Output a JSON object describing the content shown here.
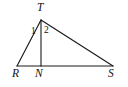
{
  "figure": {
    "type": "geometry-diagram",
    "shape": "triangle-with-cevian",
    "background_color": "#ffffff",
    "stroke_color": "#1a1a1a",
    "label_color": "#111111",
    "vertices": [
      {
        "id": "T",
        "label": "T",
        "x": 41,
        "y": 20,
        "role": "apex"
      },
      {
        "id": "R",
        "label": "R",
        "x": 17,
        "y": 66,
        "role": "base-left"
      },
      {
        "id": "N",
        "label": "N",
        "x": 41,
        "y": 66,
        "role": "base-foot"
      },
      {
        "id": "S",
        "label": "S",
        "x": 113,
        "y": 66,
        "role": "base-right"
      }
    ],
    "segments": [
      {
        "id": "RT",
        "from": "R",
        "to": "T"
      },
      {
        "id": "TS",
        "from": "T",
        "to": "S"
      },
      {
        "id": "RS",
        "from": "R",
        "to": "S"
      },
      {
        "id": "TN",
        "from": "T",
        "to": "N",
        "kind": "cevian"
      }
    ],
    "angle_labels": [
      {
        "id": "angle-1",
        "label": "1",
        "at_vertex": "T",
        "side": "left"
      },
      {
        "id": "angle-2",
        "label": "2",
        "at_vertex": "T",
        "side": "right"
      }
    ]
  }
}
